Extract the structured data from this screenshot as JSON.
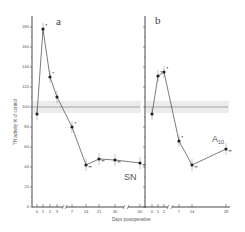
{
  "chart_data": [
    {
      "type": "line",
      "panel": "a",
      "region_label": "SN",
      "xlabel": "Days postoperative",
      "ylabel": "TH activity % of control",
      "ylim": [
        0,
        190
      ],
      "yticks": [
        0,
        20,
        40,
        60,
        80,
        100,
        120,
        140,
        160,
        180
      ],
      "x_tick_labels": [
        "0",
        "1",
        "2",
        "3",
        "7",
        "14",
        "21",
        "30",
        "60"
      ],
      "x": [
        0,
        1,
        2,
        3,
        7,
        14,
        21,
        30,
        60
      ],
      "values": [
        93,
        178,
        130,
        110,
        80,
        42,
        48,
        47,
        44
      ],
      "significance": [
        "",
        "*",
        "*",
        "",
        "*",
        "**",
        "**",
        "**",
        "**"
      ],
      "control_band": {
        "mean": 100,
        "low": 94,
        "high": 106
      },
      "axis_breaks": [
        "3-7",
        "30-60"
      ]
    },
    {
      "type": "line",
      "panel": "b",
      "region_label": "A10",
      "xlabel": "Days postoperative",
      "ylabel": "TH activity % of control",
      "ylim": [
        0,
        190
      ],
      "yticks": [
        0,
        20,
        40,
        60,
        80,
        100,
        120,
        140,
        160,
        180
      ],
      "x_tick_labels": [
        "0",
        "1",
        "2",
        "7",
        "14",
        "28"
      ],
      "x": [
        0,
        1,
        2,
        7,
        14,
        28
      ],
      "values": [
        93,
        131,
        135,
        66,
        42,
        58
      ],
      "significance": [
        "",
        "*",
        "*",
        "*",
        "**",
        "**"
      ],
      "control_band": {
        "mean": 100,
        "low": 94,
        "high": 106
      },
      "axis_breaks": [
        "2-7"
      ]
    }
  ],
  "labels": {
    "panel_a": "a",
    "panel_b": "b",
    "region_a": "SN",
    "region_b_main": "A",
    "region_b_sub": "10",
    "xlabel": "Days postoperative",
    "ylabel": "TH activity % of control"
  }
}
